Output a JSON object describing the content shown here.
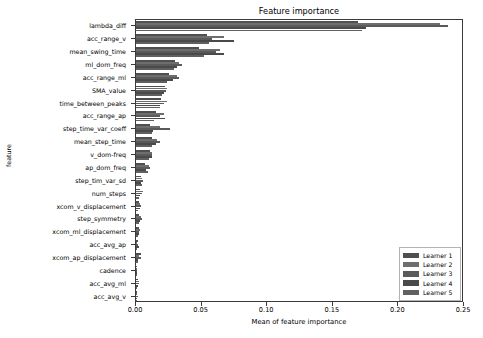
{
  "chart_data": {
    "type": "bar",
    "orientation": "horizontal",
    "title": "Feature importance",
    "xlabel": "Mean of feature importance",
    "ylabel": "feature",
    "xlim": [
      0.0,
      0.25
    ],
    "xticks": [
      0.0,
      0.05,
      0.1,
      0.15,
      0.2,
      0.25
    ],
    "xtick_labels": [
      "0.00",
      "0.05",
      "0.10",
      "0.15",
      "0.20",
      "0.25"
    ],
    "grid": false,
    "legend_position": "lower right",
    "categories": [
      "lambda_diff",
      "acc_range_v",
      "mean_swing_time",
      "ml_dom_freq",
      "acc_range_ml",
      "SMA_value",
      "time_between_peaks",
      "acc_range_ap",
      "step_time_var_coeff",
      "mean_step_time",
      "v_dom-freq",
      "ap_dom_freq",
      "step_tim_var_sd",
      "num_steps",
      "xcom_v_displacement",
      "step_symmetry",
      "xcom_ml_displacement",
      "acc_avg_ap",
      "xcom_ap_displacement",
      "cadence",
      "acc_avg_ml",
      "acc_avg_v"
    ],
    "series": [
      {
        "name": "Learner 1",
        "color": "#4f4f4f",
        "values": [
          0.169,
          0.054,
          0.048,
          0.03,
          0.025,
          0.022,
          0.019,
          0.015,
          0.011,
          0.012,
          0.011,
          0.007,
          0.0035,
          0.0028,
          0.0022,
          0.0026,
          0.002,
          0.0012,
          0.0035,
          0.0006,
          0.0016,
          0.0004
        ]
      },
      {
        "name": "Learner 2",
        "color": "#6e6e6e",
        "values": [
          0.232,
          0.067,
          0.064,
          0.033,
          0.031,
          0.024,
          0.024,
          0.021,
          0.018,
          0.016,
          0.012,
          0.01,
          0.0047,
          0.0054,
          0.0029,
          0.0036,
          0.003,
          0.001,
          0.0024,
          0.0007,
          0.0022,
          0.0006
        ]
      },
      {
        "name": "Learner 3",
        "color": "#5a5a5a",
        "values": [
          0.238,
          0.058,
          0.061,
          0.035,
          0.033,
          0.023,
          0.021,
          0.018,
          0.026,
          0.018,
          0.012,
          0.011,
          0.0052,
          0.0049,
          0.0041,
          0.0044,
          0.0024,
          0.0016,
          0.0041,
          0.0005,
          0.0026,
          0.0012
        ]
      },
      {
        "name": "Learner 4",
        "color": "#4a4a4a",
        "values": [
          0.175,
          0.075,
          0.067,
          0.031,
          0.028,
          0.021,
          0.018,
          0.022,
          0.013,
          0.015,
          0.012,
          0.008,
          0.0039,
          0.0032,
          0.0033,
          0.0027,
          0.0021,
          0.0021,
          0.0018,
          0.0009,
          0.0013,
          0.001
        ]
      },
      {
        "name": "Learner 5",
        "color": "#606060",
        "values": [
          0.172,
          0.056,
          0.052,
          0.029,
          0.024,
          0.02,
          0.018,
          0.014,
          0.012,
          0.012,
          0.01,
          0.009,
          0.0044,
          0.0024,
          0.0018,
          0.0022,
          0.0017,
          0.0009,
          0.0015,
          0.0004,
          0.0011,
          0.0007
        ]
      }
    ]
  },
  "legend": {
    "items": [
      {
        "label": "Learner 1",
        "color": "#4f4f4f"
      },
      {
        "label": "Learner 2",
        "color": "#6e6e6e"
      },
      {
        "label": "Learner 3",
        "color": "#5a5a5a"
      },
      {
        "label": "Learner 4",
        "color": "#4a4a4a"
      },
      {
        "label": "Learner 5",
        "color": "#606060"
      }
    ]
  },
  "axes": {
    "title": "Feature importance",
    "xlabel": "Mean of feature importance",
    "ylabel": "feature"
  }
}
